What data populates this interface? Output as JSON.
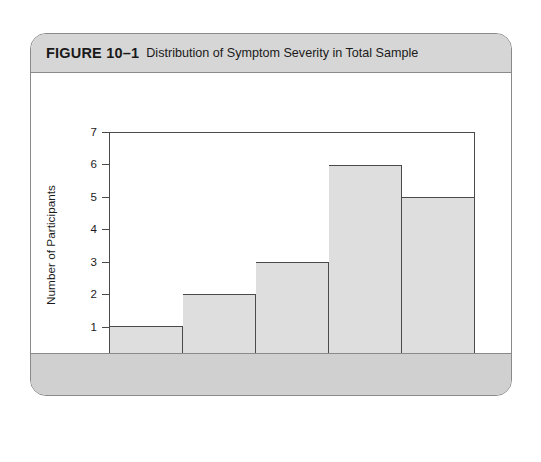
{
  "figure": {
    "number": "FIGURE 10–1",
    "caption": "Distribution of Symptom Severity in Total Sample"
  },
  "colors": {
    "card_border": "#8a8a8a",
    "header_band": "#d6d6d6",
    "footer_band": "#d0d0d0",
    "bar_fill": "#dedede",
    "axis_line": "#4a4a4a",
    "text": "#1a1a1a"
  },
  "chart_data": {
    "type": "bar",
    "title": "Distribution of Symptom Severity in Total Sample",
    "xlabel": "Symptom Severity",
    "ylabel": "Number of Participants",
    "categories": [
      "Much worse",
      "Slightly worse",
      "No change",
      "Slightly improved",
      "Much improved"
    ],
    "values": [
      1,
      2,
      3,
      6,
      5
    ],
    "ylim": [
      0,
      7
    ],
    "yticks": [
      0,
      1,
      2,
      3,
      4,
      5,
      6,
      7
    ],
    "ytick_labels": [
      "0",
      "1",
      "2",
      "3",
      "4",
      "5",
      "6",
      "7"
    ],
    "grid": false,
    "legend": null,
    "bar_style": "contiguous-histogram",
    "n_total": 17
  }
}
